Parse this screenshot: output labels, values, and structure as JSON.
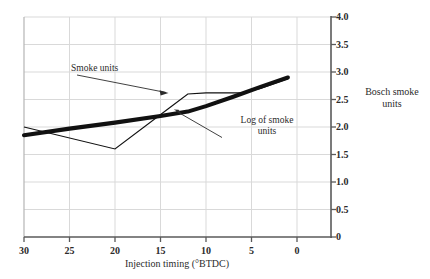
{
  "chart_data": {
    "type": "line",
    "title": "",
    "xlabel": "Injection timing (°BTDC)",
    "ylabel": "Bosch smoke units",
    "xticks": [
      30,
      25,
      20,
      15,
      10,
      5,
      0
    ],
    "xtick_labels": [
      "30",
      "25",
      "20",
      "15",
      "10",
      "5",
      "0"
    ],
    "yticks": [
      0,
      0.5,
      1.0,
      1.5,
      2.0,
      2.5,
      3.0,
      3.5,
      4.0
    ],
    "ytick_labels": [
      "0",
      "0.5",
      "1.0",
      "1.5",
      "2.0",
      "2.5",
      "3.0",
      "3.5",
      "4.0"
    ],
    "xlim": [
      30,
      -1.5
    ],
    "ylim": [
      0,
      4.0
    ],
    "x_axis_inverted": true,
    "y_axis_position": "right",
    "grid": true,
    "grid_color": "#d9d9d9",
    "legend": "annotations",
    "series": [
      {
        "name": "Smoke units",
        "style": "thin",
        "color": "#111111",
        "linewidth": 1,
        "x": [
          30,
          20,
          14,
          12,
          10,
          6,
          4,
          1
        ],
        "y": [
          2.0,
          1.6,
          2.35,
          2.6,
          2.62,
          2.62,
          2.7,
          2.88
        ]
      },
      {
        "name": "Log of smoke units",
        "style": "thick",
        "color": "#111111",
        "linewidth": 4,
        "x": [
          30,
          25,
          20,
          15,
          12,
          10,
          7,
          4,
          1
        ],
        "y": [
          1.85,
          1.97,
          2.08,
          2.2,
          2.28,
          2.38,
          2.55,
          2.73,
          2.9
        ]
      }
    ],
    "annotations": [
      {
        "text": "Smoke units",
        "target_series": "Smoke units",
        "label_x": 13.6,
        "label_y": 3.02,
        "arrow_to_x": 12.2,
        "arrow_to_y": 2.55
      },
      {
        "text_lines": [
          "Log of smoke",
          "units"
        ],
        "text": "Log of smoke units",
        "target_series": "Log of smoke units",
        "label_x": 5.2,
        "label_y": 2.05,
        "arrow_to_x": 11.0,
        "arrow_to_y": 2.4
      }
    ]
  },
  "labels": {
    "x_axis_title": "Injection timing (°BTDC)",
    "y_axis_title_line1": "Bosch smoke",
    "y_axis_title_line2": "units",
    "annotation_smoke": "Smoke units",
    "annotation_log_line1": "Log of smoke",
    "annotation_log_line2": "units"
  },
  "axis": {
    "y": {
      "t0": "4.0",
      "t1": "3.5",
      "t2": "3.0",
      "t3": "2.5",
      "t4": "2.0",
      "t5": "1.5",
      "t6": "1.0",
      "t7": "0.5",
      "t8": "0"
    },
    "x": {
      "t0": "30",
      "t1": "25",
      "t2": "20",
      "t3": "15",
      "t4": "10",
      "t5": "5",
      "t6": "0"
    }
  },
  "colors": {
    "grid": "#d9d9d9",
    "axis": "#555555",
    "series": "#111111",
    "text": "#2b2b2b",
    "background": "#ffffff"
  }
}
